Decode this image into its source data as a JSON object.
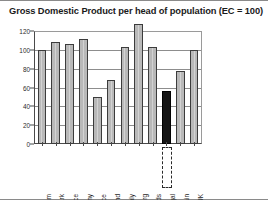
{
  "chart_data": {
    "type": "bar",
    "title": "Gross Domestic Product per head of population (EC = 100)",
    "xlabel": "",
    "ylabel": "",
    "ylim": [
      0,
      120
    ],
    "yticks": [
      0,
      20,
      40,
      60,
      80,
      100,
      120
    ],
    "grid": true,
    "legend": "none",
    "categories": [
      "Belgium",
      "Denmark",
      "France",
      "Germany",
      "Greece",
      "Ireland",
      "Italy",
      "Luxembourg",
      "Netherlands",
      "Portugal",
      "Spain",
      "UK"
    ],
    "values": [
      100,
      108,
      106,
      112,
      50,
      68,
      103,
      127,
      103,
      56,
      78,
      100
    ],
    "highlight_category": "Portugal",
    "highlight_note": "Portugal bar drawn in dark fill with dashed box around its axis label",
    "colors": {
      "bar_fill": "#b9b9b9",
      "bar_border": "#3c3c3c",
      "highlight_fill": "#151515",
      "gridline": "#8d8d8d",
      "axis": "#4a4a4a",
      "text": "#1a1a1a",
      "background": "#ffffff"
    }
  }
}
